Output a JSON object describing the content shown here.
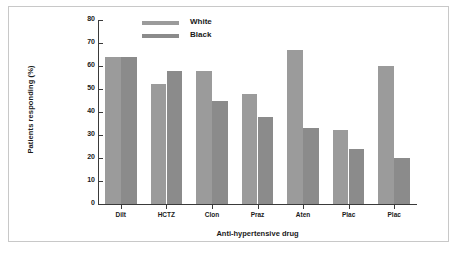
{
  "chart_data": {
    "type": "bar",
    "title": "",
    "xlabel": "Anti-hypertensive drug",
    "ylabel": "Patients responding (%)",
    "categories": [
      "Dilt",
      "HCTZ",
      "Clon",
      "Praz",
      "Aten",
      "Plac",
      "Plac"
    ],
    "series": [
      {
        "name": "White",
        "color": "#9b9b9b",
        "values": [
          64,
          52,
          58,
          48,
          67,
          32,
          60
        ]
      },
      {
        "name": "Black",
        "color": "#8b8b8b",
        "values": [
          64,
          58,
          45,
          38,
          33,
          24,
          20
        ]
      }
    ],
    "ylim": [
      0,
      80
    ],
    "yticks": [
      0,
      10,
      20,
      30,
      40,
      50,
      60,
      70,
      80
    ],
    "ytick_labels": [
      "0",
      "10",
      "20",
      "30",
      "40",
      "50",
      "60",
      "70",
      "80"
    ],
    "grid": false,
    "legend_position": "top-left-inside"
  },
  "legend": {
    "entries": [
      {
        "label": "White"
      },
      {
        "label": "Black"
      }
    ]
  },
  "figure": {
    "border_color": "#c8c8c8",
    "background": "#ffffff",
    "axis_color": "#3a3a3a"
  }
}
